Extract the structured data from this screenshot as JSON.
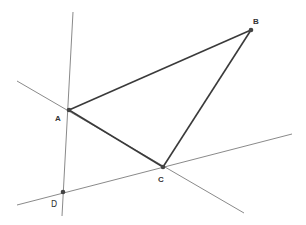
{
  "diagram": {
    "type": "geometry-construction",
    "colors": {
      "background": "#ffffff",
      "triangle_edge": "#3a3a3a",
      "construction_line": "#8a8a8a",
      "point": "#444444",
      "label": "#333333"
    },
    "points": {
      "A": {
        "label": "A",
        "x": 69,
        "y": 110,
        "label_x": 55,
        "label_y": 121
      },
      "B": {
        "label": "B",
        "x": 251,
        "y": 30,
        "label_x": 253,
        "label_y": 24
      },
      "C": {
        "label": "C",
        "x": 163,
        "y": 167,
        "label_x": 158,
        "label_y": 182
      },
      "D": {
        "label": "D",
        "x": 63,
        "y": 192,
        "label_x": 51,
        "label_y": 207
      }
    },
    "segments": [
      {
        "name": "segment-ab",
        "from": "A",
        "to": "B"
      },
      {
        "name": "segment-bc",
        "from": "B",
        "to": "C"
      },
      {
        "name": "segment-ac",
        "from": "A",
        "to": "C"
      }
    ],
    "lines": [
      {
        "name": "line-through-a-d",
        "x1": 73,
        "y1": 12,
        "x2": 62,
        "y2": 216
      },
      {
        "name": "line-through-a-c",
        "x1": 17,
        "y1": 81,
        "x2": 244,
        "y2": 213
      },
      {
        "name": "line-through-d-c",
        "x1": 17,
        "y1": 205,
        "x2": 292,
        "y2": 134
      }
    ]
  }
}
